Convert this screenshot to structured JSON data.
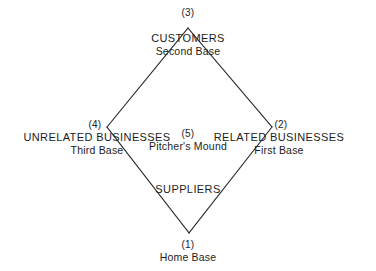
{
  "diagram": {
    "background_color": "#ffffff",
    "line_color": "#2a2a2a",
    "text_color": "#1c1c1c",
    "nodes": [
      {
        "id": "home",
        "number": "(1)",
        "name": "",
        "base": "Home Base",
        "role": "bottom-vertex"
      },
      {
        "id": "related",
        "number": "(2)",
        "name": "RELATED BUSINESSES",
        "base": "First Base",
        "role": "right-vertex"
      },
      {
        "id": "customers",
        "number": "(3)",
        "name": "CUSTOMERS",
        "base": "Second Base",
        "role": "top-vertex"
      },
      {
        "id": "unrelated",
        "number": "(4)",
        "name": "UNRELATED BUSINESSES",
        "base": "Third Base",
        "role": "left-vertex"
      },
      {
        "id": "mound",
        "number": "(5)",
        "name": "",
        "base": "Pitcher's Mound",
        "role": "center"
      }
    ],
    "center_label": "SUPPLIERS",
    "vertices": {
      "top": {
        "x": 188,
        "y": 28
      },
      "right": {
        "x": 272,
        "y": 127
      },
      "bottom": {
        "x": 189,
        "y": 233
      },
      "left": {
        "x": 107,
        "y": 127
      }
    }
  }
}
